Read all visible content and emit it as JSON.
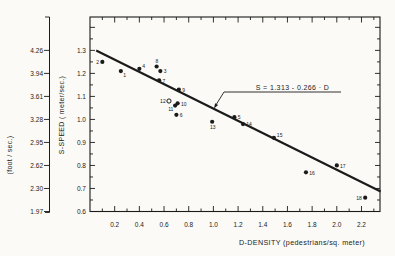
{
  "figure": {
    "background": "#fbfaf6",
    "ink": "#1b1b1b"
  },
  "chart_data": {
    "type": "scatter",
    "title": "",
    "xlabel": "D-DENSITY (pedestrians/sq. meter)",
    "ylabel": "S-SPEED   ( meter/sec.)",
    "ylabel_secondary": "(foot / sec.)",
    "xlim": [
      0,
      2.35
    ],
    "ylim": [
      0.6,
      1.445
    ],
    "grid": false,
    "legend_position": "none",
    "x_tick_labels": [
      "0.2",
      "0.4",
      "0.6",
      "0.8",
      "1.0",
      "1.2",
      "1.4",
      "1.6",
      "1.8",
      "2.0",
      "2.2"
    ],
    "x_minor_step": 0.1,
    "y_tick_labels_meter": [
      "1.3",
      "1.2",
      "1.1",
      "1.0",
      "0.9",
      "0.8",
      "0.7",
      "0.6"
    ],
    "y_tick_labels_foot": [
      "4.26",
      "3.94",
      "3.61",
      "3.28",
      "2.95",
      "2.62",
      "2.30",
      "1.97"
    ],
    "points": [
      {
        "id": "1",
        "d": 0.25,
        "s": 1.21,
        "marker": "filled",
        "label_pos": "below-right"
      },
      {
        "id": "2",
        "d": 0.1,
        "s": 1.25,
        "marker": "filled",
        "label_pos": "left"
      },
      {
        "id": "3",
        "d": 0.57,
        "s": 1.21,
        "marker": "filled",
        "label_pos": "right"
      },
      {
        "id": "4",
        "d": 0.4,
        "s": 1.22,
        "marker": "filled",
        "label_pos": "upper-right"
      },
      {
        "id": "5",
        "d": 1.17,
        "s": 1.01,
        "marker": "filled",
        "label_pos": "right"
      },
      {
        "id": "6",
        "d": 0.7,
        "s": 1.02,
        "marker": "filled",
        "label_pos": "right"
      },
      {
        "id": "7",
        "d": 0.56,
        "s": 1.17,
        "marker": "filled",
        "label_pos": "right"
      },
      {
        "id": "8",
        "d": 0.54,
        "s": 1.23,
        "marker": "filled",
        "label_pos": "above"
      },
      {
        "id": "9",
        "d": 0.72,
        "s": 1.13,
        "marker": "filled",
        "label_pos": "right"
      },
      {
        "id": "10",
        "d": 0.71,
        "s": 1.07,
        "marker": "filled",
        "label_pos": "right"
      },
      {
        "id": "11",
        "d": 0.69,
        "s": 1.06,
        "marker": "filled",
        "label_pos": "below-left"
      },
      {
        "id": "12",
        "d": 0.64,
        "s": 1.08,
        "marker": "open",
        "label_pos": "left"
      },
      {
        "id": "13",
        "d": 0.99,
        "s": 0.99,
        "marker": "filled",
        "label_pos": "below"
      },
      {
        "id": "14",
        "d": 1.24,
        "s": 0.98,
        "marker": "filled",
        "label_pos": "right"
      },
      {
        "id": "15",
        "d": 1.49,
        "s": 0.92,
        "marker": "filled",
        "label_pos": "upper-right"
      },
      {
        "id": "16",
        "d": 1.75,
        "s": 0.77,
        "marker": "filled",
        "label_pos": "right"
      },
      {
        "id": "17",
        "d": 2.0,
        "s": 0.8,
        "marker": "filled",
        "label_pos": "right"
      },
      {
        "id": "18",
        "d": 2.23,
        "s": 0.66,
        "marker": "filled",
        "label_pos": "left"
      }
    ],
    "regression_line": {
      "equation_label": "S = 1.313 - 0.266 · D",
      "intercept": 1.313,
      "slope": -0.266,
      "d_start": 0.05,
      "d_end": 2.355
    }
  }
}
